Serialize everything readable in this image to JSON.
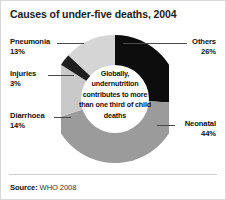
{
  "chart_data": {
    "type": "pie",
    "variant": "donut",
    "title": "Causes of under-five deaths, 2004",
    "xlabel": "",
    "ylabel": "",
    "legend_position": "callout-labels",
    "grid": false,
    "units": "percent",
    "start_angle_deg": 0,
    "direction": "clockwise",
    "categories": [
      "Others",
      "Neonatal",
      "Diarrhoea",
      "Injuries",
      "Pneumonia"
    ],
    "values": [
      26,
      44,
      14,
      3,
      13
    ],
    "slices": [
      {
        "label": "Others",
        "value": 26,
        "display": "26%",
        "color": "#0d0d0d",
        "label_side": "right"
      },
      {
        "label": "Neonatal",
        "value": 44,
        "display": "44%",
        "color": "#9b9b9b",
        "label_side": "right"
      },
      {
        "label": "Diarrhoea",
        "value": 14,
        "display": "14%",
        "color": "#c9c9c9",
        "label_side": "left"
      },
      {
        "label": "Injuries",
        "value": 3,
        "display": "3%",
        "color": "#1f1f1f",
        "label_side": "left"
      },
      {
        "label": "Pneumonia",
        "value": 13,
        "display": "13%",
        "color": "#d5d5d5",
        "label_side": "left"
      }
    ],
    "center_annotation": "Globally, undernutrition contributes to more than one third of child deaths",
    "source_label": "Source:",
    "source_value": "WHO 2008"
  },
  "colors": {
    "background": "#ffffff",
    "border": "#d8d8d8",
    "text": "#111111",
    "leader_line": "#4a4a4a",
    "footer_rule": "#cfcfcf",
    "hole": "#ffffff"
  }
}
